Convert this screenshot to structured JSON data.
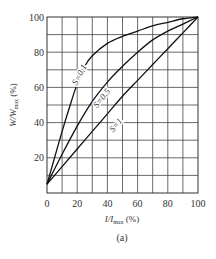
{
  "chart_data": {
    "type": "line",
    "title": "",
    "caption": "(a)",
    "xlabel": "I/I_max (%)",
    "ylabel": "W/W_max (%)",
    "xlim": [
      0,
      100
    ],
    "ylim": [
      0,
      100
    ],
    "grid": true,
    "grid_step": 10,
    "x_ticks": [
      0,
      20,
      40,
      60,
      80,
      100
    ],
    "y_ticks": [
      20,
      40,
      60,
      80,
      100
    ],
    "x_tick_labels": [
      "0",
      "20",
      "40",
      "60",
      "80",
      "100"
    ],
    "y_tick_labels": [
      "20",
      "40",
      "60",
      "80",
      "100"
    ],
    "legend": "inline labels on curves",
    "series": [
      {
        "name": "S=0.1",
        "x": [
          0,
          5,
          10,
          15,
          20,
          25,
          30,
          40,
          50,
          60,
          70,
          80,
          90,
          100
        ],
        "values": [
          5,
          20,
          35,
          49,
          62,
          72,
          78,
          85,
          89,
          92,
          95,
          97,
          99,
          100
        ]
      },
      {
        "name": "S=0.5",
        "x": [
          0,
          10,
          20,
          30,
          40,
          50,
          60,
          70,
          80,
          90,
          100
        ],
        "values": [
          5,
          22,
          38,
          52,
          63,
          72,
          80,
          87,
          92,
          96,
          100
        ]
      },
      {
        "name": "S=1",
        "x": [
          0,
          10,
          20,
          30,
          40,
          50,
          60,
          70,
          80,
          90,
          100
        ],
        "values": [
          5,
          15,
          25,
          35,
          45,
          55,
          64,
          73,
          82,
          91,
          100
        ]
      }
    ]
  },
  "labels": {
    "xlabel_main": "I/I",
    "xlabel_sub": "max",
    "xlabel_unit": " (%)",
    "ylabel_main": "W/W",
    "ylabel_sub": "max",
    "ylabel_unit": " (%)",
    "caption": "(a)",
    "curve_labels": [
      "S=0.1",
      "S=0.5",
      "S=1"
    ]
  }
}
